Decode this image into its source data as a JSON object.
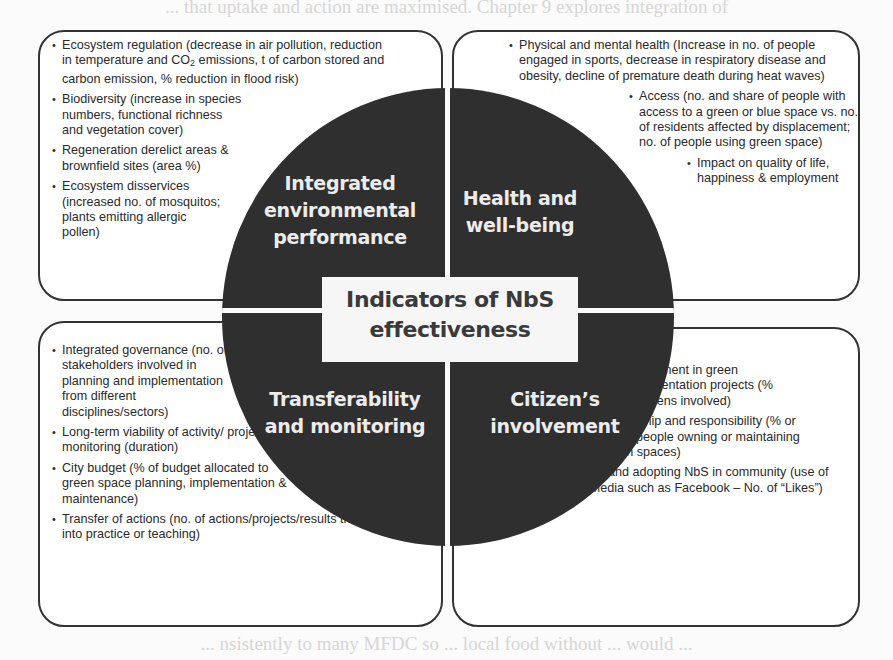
{
  "background_text": {
    "top": "... that uptake and action are maximised. Chapter 9 explores integration of",
    "bottom": "... nsistently to many MFDC so ... local food without ... would ..."
  },
  "diagram": {
    "title_line1": "Indicators of NbS",
    "title_line2": "effectiveness",
    "quadrants": [
      {
        "id": "integrated-environmental-performance",
        "label_lines": [
          "Integrated",
          "environmental",
          "performance"
        ],
        "items": [
          "Ecosystem regulation (decrease in air pollution, reduction in temperature and CO2 emissions, t of carbon stored and carbon emission, % reduction in flood risk)",
          "Biodiversity (increase in species numbers, functional richness and vegetation cover)",
          "Regeneration derelict areas & brownfield sites (area %)",
          "Ecosystem disservices (increased no. of mosquitos; plants emitting allergic pollen)"
        ]
      },
      {
        "id": "health-and-well-being",
        "label_lines": [
          "Health and",
          "well-being"
        ],
        "items": [
          "Physical and mental health (Increase in no. of people engaged in sports, decrease in respiratory disease and obesity, decline of premature death during heat waves)",
          "Access (no. and share of people with access to a green or blue space vs. no. of residents affected by displacement; no. of people using green space)",
          "Impact on quality of life, happiness & employment"
        ]
      },
      {
        "id": "transferability-and-monitoring",
        "label_lines": [
          "Transferability",
          "and monitoring"
        ],
        "items": [
          "Integrated governance (no. of stakeholders involved in planning and implementation from different disciplines/sectors)",
          "Long-term viability of activity/ projects & monitoring (duration)",
          "City budget (% of budget allocated to green space planning, implementation & maintenance)",
          "Transfer of actions (no. of actions/projects/results transferred into practice or teaching)"
        ]
      },
      {
        "id": "citizens-involvement",
        "label_lines": [
          "Citizen’s",
          "involvement"
        ],
        "items": [
          "Involvement in green implementation projects (% of citizens involved)",
          "Ownership and responsibility (% or no. of people owning or maintaining green spaces)",
          "Sharing and adopting NbS in community (use of New Media such as Facebook – No. of “Likes”)"
        ]
      }
    ],
    "colors": {
      "circle_fill": "#2f2f2f",
      "quadrant_label": "#ececec",
      "center_box_fill": "#f6f6f6",
      "center_text": "#3a3a3a",
      "box_border": "#333333"
    }
  }
}
